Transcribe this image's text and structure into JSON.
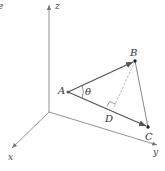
{
  "figure": {
    "corner_fragment": "e",
    "axes": {
      "x_label": "x",
      "y_label": "y",
      "z_label": "z"
    },
    "points": {
      "A": "A",
      "B": "B",
      "C": "C",
      "D": "D"
    },
    "angle_label": "θ",
    "colors": {
      "vector": "#555555",
      "axis": "#777777",
      "dashed": "#999999",
      "point": "#222222"
    }
  }
}
